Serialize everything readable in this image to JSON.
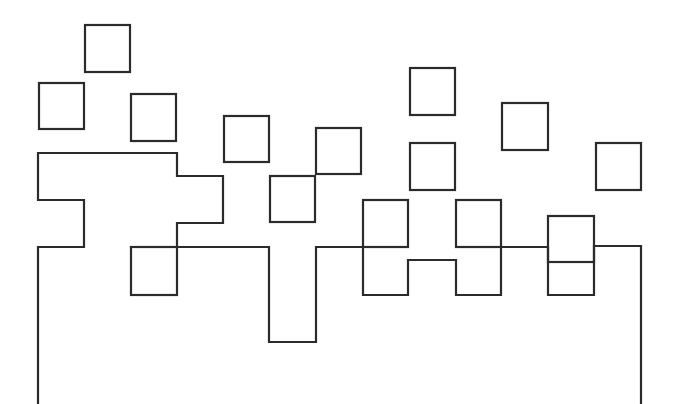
{
  "diagram": {
    "colors": {
      "stroke": "#2b2b2b",
      "background": "#ffffff"
    },
    "free_squares": [
      {
        "id": "sq-1",
        "x": 85,
        "y": 25,
        "w": 45,
        "h": 47
      },
      {
        "id": "sq-2",
        "x": 39,
        "y": 83,
        "w": 45,
        "h": 46
      },
      {
        "id": "sq-3",
        "x": 131,
        "y": 94,
        "w": 45,
        "h": 47
      },
      {
        "id": "sq-4",
        "x": 224,
        "y": 116,
        "w": 45,
        "h": 46
      },
      {
        "id": "sq-5",
        "x": 316,
        "y": 128,
        "w": 45,
        "h": 46
      },
      {
        "id": "sq-6",
        "x": 410,
        "y": 68,
        "w": 45,
        "h": 47
      },
      {
        "id": "sq-7",
        "x": 502,
        "y": 103,
        "w": 46,
        "h": 47
      },
      {
        "id": "sq-8",
        "x": 410,
        "y": 143,
        "w": 45,
        "h": 47
      },
      {
        "id": "sq-9",
        "x": 596,
        "y": 143,
        "w": 45,
        "h": 47
      },
      {
        "id": "sq-10",
        "x": 270,
        "y": 176,
        "w": 45,
        "h": 46
      },
      {
        "id": "sq-11",
        "x": 131,
        "y": 247,
        "w": 46,
        "h": 48
      },
      {
        "id": "sq-12",
        "x": 363,
        "y": 200,
        "w": 45,
        "h": 47
      },
      {
        "id": "sq-13",
        "x": 456,
        "y": 200,
        "w": 45,
        "h": 47
      },
      {
        "id": "sq-14",
        "x": 548,
        "y": 216,
        "w": 46,
        "h": 46
      }
    ],
    "outlines": [
      {
        "id": "left-stepped-shape",
        "points": "38,404 38,247 84,247 84,200 38,200 38,153 177,153 177,176 223,176 223,223 177,223 177,247"
      },
      {
        "id": "main-crenellated-outline",
        "points": "131,247 269,247 269,342 316,342 316,247 363,247 363,295 408,295 408,260 456,260 456,295 501,295 501,247 548,247 548,295 594,295 594,246 641,246 641,404"
      }
    ]
  }
}
